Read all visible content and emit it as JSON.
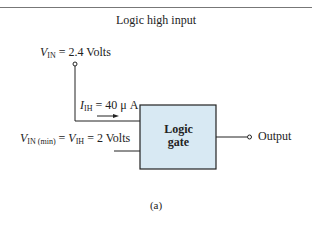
{
  "title": "Logic high input",
  "caption": "(a)",
  "input_supply": {
    "symbol": "V",
    "subscript": "IN",
    "eq": " = 2.4 Volts"
  },
  "input_current": {
    "symbol": "I",
    "subscript": "IH",
    "eq": " = 40 μ A"
  },
  "input_min": {
    "symbol1": "V",
    "subscript1": "IN (min)",
    "mid": " = ",
    "symbol2": "V",
    "subscript2": "IH",
    "eq": " = 2 Volts"
  },
  "gate": {
    "line1": "Logic",
    "line2": "gate",
    "fill": "#d8e9f3",
    "border": "#222222"
  },
  "output_label": "Output"
}
